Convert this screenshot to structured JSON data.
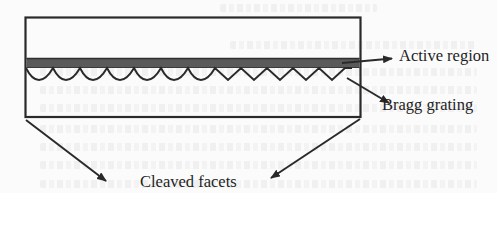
{
  "figure": {
    "type": "schematic",
    "labels": {
      "active_region": "Active region",
      "bragg_grating": "Bragg grating",
      "cleaved_facets": "Cleaved facets"
    },
    "colors": {
      "stroke": "#2a2a2a",
      "active_region_fill": "#585858",
      "background": "#fbfbfb"
    }
  }
}
